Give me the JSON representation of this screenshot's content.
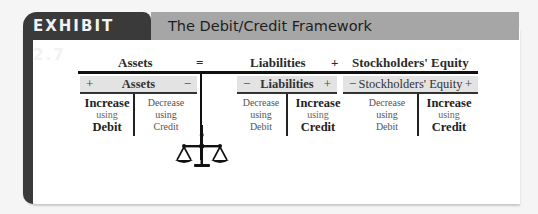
{
  "exhibit": {
    "tab_label": "EXHIBIT 2.7",
    "title": "The Debit/Credit Framework"
  },
  "equation": {
    "left": "Assets",
    "equals": "=",
    "middle": "Liabilities",
    "plus": "+",
    "right": "Stockholders' Equity"
  },
  "accounts": [
    {
      "name": "Assets",
      "left_sign": "+",
      "right_sign": "−",
      "left": {
        "line1": "Increase",
        "line2": "using",
        "line3": "Debit",
        "emphasis": true
      },
      "right": {
        "line1": "Decrease",
        "line2": "using",
        "line3": "Credit",
        "emphasis": false
      }
    },
    {
      "name": "Liabilities",
      "left_sign": "−",
      "right_sign": "+",
      "left": {
        "line1": "Decrease",
        "line2": "using",
        "line3": "Debit",
        "emphasis": false
      },
      "right": {
        "line1": "Increase",
        "line2": "using",
        "line3": "Credit",
        "emphasis": true
      }
    },
    {
      "name": "Stockholders' Equity",
      "left_sign": "−",
      "right_sign": "+",
      "left": {
        "line1": "Decrease",
        "line2": "using",
        "line3": "Debit",
        "emphasis": false
      },
      "right": {
        "line1": "Increase",
        "line2": "using",
        "line3": "Credit",
        "emphasis": true
      }
    }
  ],
  "icons": {
    "balance": "scales-of-justice-icon"
  },
  "colors": {
    "tab_bg": "#3a3a3a",
    "title_bg": "#a6a6a6",
    "header_bg": "#e3e3e3"
  }
}
